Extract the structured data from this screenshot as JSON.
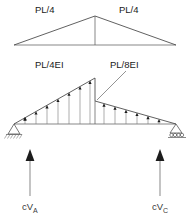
{
  "figure": {
    "background_color": "#ffffff",
    "line_color": "#555555",
    "text_color": "#1a1a1a",
    "arrow_color": "#1c1c1c",
    "arrow_shaft_color": "#b5b5b5"
  },
  "moment_diagram": {
    "name": "bending-moment-diagram",
    "left_label": "PL/4",
    "right_label": "PL/4",
    "shape": "triangle",
    "peak_position": "center"
  },
  "mei_diagram": {
    "name": "m-over-ei-diagram",
    "left_label": "PL/4EI",
    "right_label": "PL/8EI",
    "left_peak_value": "PL/4EI",
    "right_peak_value": "PL/8EI",
    "discontinuity": "center",
    "left_support_type": "pin",
    "right_support_type": "roller"
  },
  "reactions": {
    "left": {
      "name": "reaction-left",
      "prefix": "cV",
      "subscript": "A",
      "direction": "up"
    },
    "right": {
      "name": "reaction-right",
      "prefix": "cV",
      "subscript": "C",
      "direction": "up"
    }
  }
}
